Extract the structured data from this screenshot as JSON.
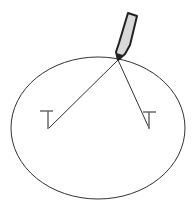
{
  "diagram": {
    "colors": {
      "stroke": "#333333",
      "pin": "#6a6a6a",
      "pencil_fill": "#d9d9d9",
      "pencil_outline": "#222222",
      "background": "#ffffff"
    },
    "ellipse": {
      "cx": 98,
      "cy": 128,
      "rx": 87,
      "ry": 71
    },
    "pencil_tip": {
      "x": 118,
      "y": 60
    },
    "pins": [
      {
        "name": "left-pin",
        "x": 48,
        "bar_y": 111,
        "bottom_y": 129
      },
      {
        "name": "right-pin",
        "x": 149,
        "bar_y": 112,
        "bottom_y": 129
      }
    ]
  }
}
